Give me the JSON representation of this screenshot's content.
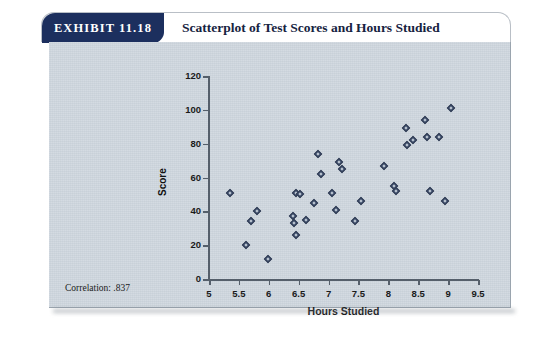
{
  "card": {
    "exhibit_tag": "EXHIBIT 11.18",
    "title": "Scatterplot of Test Scores and Hours Studied",
    "correlation_note": "Correlation: .837"
  },
  "chart_data": {
    "type": "scatter",
    "title": "Scatterplot of Test Scores and Hours Studied",
    "xlabel": "Hours Studied",
    "ylabel": "Score",
    "xlim": [
      5,
      9.5
    ],
    "ylim": [
      0,
      120
    ],
    "xticks": [
      "5",
      "5.5",
      "6",
      "6.5",
      "7",
      "7.5",
      "8",
      "8.5",
      "9",
      "9.5"
    ],
    "xtick_values": [
      5,
      5.5,
      6,
      6.5,
      7,
      7.5,
      8,
      8.5,
      9,
      9.5
    ],
    "yticks": [
      "0",
      "20",
      "40",
      "60",
      "80",
      "100",
      "120"
    ],
    "ytick_values": [
      0,
      20,
      40,
      60,
      80,
      100,
      120
    ],
    "grid": false,
    "legend": false,
    "marker": "diamond",
    "marker_color": "#4b5a78",
    "correlation": 0.837,
    "points": [
      {
        "x": 5.35,
        "y": 51
      },
      {
        "x": 5.8,
        "y": 40
      },
      {
        "x": 5.7,
        "y": 34
      },
      {
        "x": 5.62,
        "y": 20
      },
      {
        "x": 5.98,
        "y": 12
      },
      {
        "x": 6.45,
        "y": 51
      },
      {
        "x": 6.52,
        "y": 50
      },
      {
        "x": 6.4,
        "y": 37
      },
      {
        "x": 6.42,
        "y": 33
      },
      {
        "x": 6.45,
        "y": 26
      },
      {
        "x": 6.62,
        "y": 35
      },
      {
        "x": 6.75,
        "y": 45
      },
      {
        "x": 6.83,
        "y": 74
      },
      {
        "x": 6.88,
        "y": 62
      },
      {
        "x": 7.05,
        "y": 51
      },
      {
        "x": 7.12,
        "y": 41
      },
      {
        "x": 7.18,
        "y": 69
      },
      {
        "x": 7.22,
        "y": 65
      },
      {
        "x": 7.45,
        "y": 34
      },
      {
        "x": 7.55,
        "y": 46
      },
      {
        "x": 7.92,
        "y": 67
      },
      {
        "x": 8.1,
        "y": 55
      },
      {
        "x": 8.12,
        "y": 52
      },
      {
        "x": 8.3,
        "y": 89
      },
      {
        "x": 8.32,
        "y": 79
      },
      {
        "x": 8.42,
        "y": 82
      },
      {
        "x": 8.62,
        "y": 94
      },
      {
        "x": 8.65,
        "y": 84
      },
      {
        "x": 8.7,
        "y": 52
      },
      {
        "x": 8.85,
        "y": 84
      },
      {
        "x": 8.95,
        "y": 46
      },
      {
        "x": 9.05,
        "y": 101
      }
    ]
  }
}
